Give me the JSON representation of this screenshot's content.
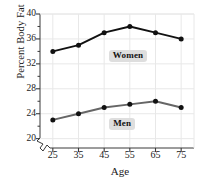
{
  "chart_data": {
    "type": "line",
    "title": "",
    "xlabel": "Age",
    "ylabel": "Percent Body Fat",
    "x": [
      25,
      35,
      45,
      55,
      65,
      75
    ],
    "xticklabels": [
      "25",
      "35",
      "45",
      "55",
      "65",
      "75"
    ],
    "yticklabels": [
      "20",
      "24",
      "28",
      "32",
      "36",
      "40"
    ],
    "yticks": [
      20,
      24,
      28,
      32,
      36,
      40
    ],
    "xlim": [
      20,
      80
    ],
    "ylim": [
      18.5,
      40
    ],
    "grid": true,
    "axis_break": true,
    "legend_position": "inline-annotations",
    "series": [
      {
        "name": "Women",
        "color": "#111111",
        "marker": "circle",
        "values": [
          34,
          35,
          37,
          38,
          37,
          36
        ]
      },
      {
        "name": "Men",
        "color": "#666666",
        "marker": "circle",
        "values": [
          23,
          24,
          25,
          25.5,
          26,
          25
        ]
      }
    ],
    "annotations": [
      {
        "text": "Women",
        "x": 55,
        "y": 33.3
      },
      {
        "text": "Men",
        "x": 52,
        "y": 22.4
      }
    ]
  },
  "colors": {
    "women_line": "#111111",
    "men_line": "#666666",
    "grid": "#e8e8e8",
    "axis": "#3a3a3a",
    "label_bg": "#dedede",
    "background": "#ffffff"
  }
}
